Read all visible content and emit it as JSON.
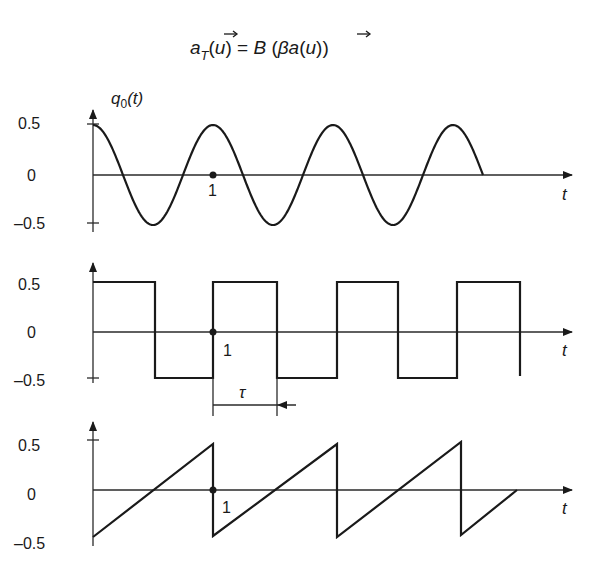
{
  "formula": {
    "lhs_var": "a",
    "lhs_sub": "T",
    "arg": "u",
    "equals": "=",
    "rhs_func": "B",
    "rhs_inner": "βa",
    "text": "a_T(u⃗) = B(βa(u⃗))"
  },
  "chart_data": [
    {
      "type": "line",
      "title": "",
      "ylabel": "q0(t)",
      "xlabel": "t",
      "description": "cosine wave q0(t) = 0.5·cos(2πt)",
      "yticks": [
        "0.5",
        "0",
        "-0.5"
      ],
      "ylim": [
        -0.5,
        0.5
      ],
      "xlim": [
        0,
        3.25
      ],
      "marked_point": {
        "x": 1,
        "y": 0,
        "label": "1"
      },
      "x": [
        0,
        0.25,
        0.5,
        0.75,
        1,
        1.25,
        1.5,
        1.75,
        2,
        2.25,
        2.5,
        2.75,
        3,
        3.25
      ],
      "values": [
        0.5,
        0,
        -0.5,
        0,
        0.5,
        0,
        -0.5,
        0,
        0.5,
        0,
        -0.5,
        0,
        0.5,
        0
      ],
      "grid": false
    },
    {
      "type": "line",
      "title": "",
      "ylabel": "",
      "xlabel": "t",
      "description": "square wave, amplitude ±0.5, half-period τ",
      "yticks": [
        "0.5",
        "0",
        "-0.5"
      ],
      "ylim": [
        -0.5,
        0.5
      ],
      "xlim": [
        0,
        3.6
      ],
      "marked_point": {
        "x": 1,
        "y": 0,
        "label": "1"
      },
      "annotation": {
        "label": "τ",
        "from_x": 1,
        "to_x": 1.53
      },
      "x": [
        0,
        0.52,
        0.52,
        1,
        1,
        1.53,
        1.53,
        2.03,
        2.03,
        2.54,
        2.54,
        3.03,
        3.03,
        3.55,
        3.55
      ],
      "values": [
        0.5,
        0.5,
        -0.5,
        -0.5,
        0.5,
        0.5,
        -0.5,
        -0.5,
        0.5,
        0.5,
        -0.5,
        -0.5,
        0.5,
        0.5,
        -0.45
      ],
      "grid": false
    },
    {
      "type": "line",
      "title": "",
      "ylabel": "",
      "xlabel": "t",
      "description": "sawtooth wave, ramps from -0.5 to 0.5 over period 1",
      "yticks": [
        "0.5",
        "0",
        "-0.5"
      ],
      "ylim": [
        -0.5,
        0.5
      ],
      "xlim": [
        0,
        3.5
      ],
      "marked_point": {
        "x": 1,
        "y": 0,
        "label": "1"
      },
      "x": [
        0,
        1,
        1,
        2.03,
        2.03,
        3.06,
        3.06,
        3.53
      ],
      "values": [
        -0.5,
        0.5,
        -0.5,
        0.5,
        -0.5,
        0.5,
        -0.5,
        0
      ],
      "grid": false
    }
  ],
  "panels": [
    {
      "ylabel": "q",
      "ylabel_sub": "0",
      "ylabel_arg": "(t)",
      "xlabel": "t",
      "yticks": [
        "0.5",
        "0",
        "–0.5"
      ],
      "point_label": "1"
    },
    {
      "ylabel": "",
      "xlabel": "t",
      "yticks": [
        "0.5",
        "0",
        "–0.5"
      ],
      "point_label": "1",
      "tau_label": "τ"
    },
    {
      "ylabel": "",
      "xlabel": "t",
      "yticks": [
        "0.5",
        "0",
        "–0.5"
      ],
      "point_label": "1"
    }
  ]
}
